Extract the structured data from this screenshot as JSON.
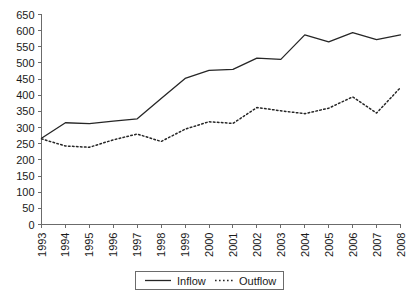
{
  "chart_data": {
    "type": "line",
    "title": "",
    "subtitle": "",
    "xlabel": "",
    "ylabel": "",
    "categories": [
      "1993",
      "1994",
      "1995",
      "1996",
      "1997",
      "1998",
      "1999",
      "2000",
      "2001",
      "2002",
      "2003",
      "2004",
      "2005",
      "2006",
      "2007",
      "2008"
    ],
    "series": [
      {
        "name": "Inflow",
        "style": "solid",
        "color": "#262626",
        "values": [
          267,
          315,
          312,
          320,
          327,
          390,
          452,
          477,
          480,
          515,
          511,
          587,
          565,
          594,
          572,
          587
        ]
      },
      {
        "name": "Outflow",
        "style": "dotted",
        "color": "#262626",
        "values": [
          265,
          243,
          239,
          262,
          280,
          257,
          295,
          318,
          313,
          362,
          352,
          343,
          360,
          395,
          345,
          424
        ]
      }
    ],
    "ylim": [
      0,
      650
    ],
    "ytick_step": 50,
    "yticks": [
      0,
      50,
      100,
      150,
      200,
      250,
      300,
      350,
      400,
      450,
      500,
      550,
      600,
      650
    ],
    "ytick_labels": [
      "0",
      "50",
      "100",
      "150",
      "200",
      "250",
      "300",
      "350",
      "400",
      "450",
      "500",
      "550",
      "600",
      "650"
    ],
    "xticks": [
      "1993",
      "1994",
      "1995",
      "1996",
      "1997",
      "1998",
      "1999",
      "2000",
      "2001",
      "2002",
      "2003",
      "2004",
      "2005",
      "2006",
      "2007",
      "2008"
    ],
    "grid": false,
    "legend_position": "bottom-center",
    "legend_entries": [
      "Inflow",
      "Outflow"
    ],
    "xtick_rotation": -90,
    "annotations": []
  },
  "legend": {
    "inflow_label": "Inflow",
    "outflow_label": "Outflow"
  }
}
